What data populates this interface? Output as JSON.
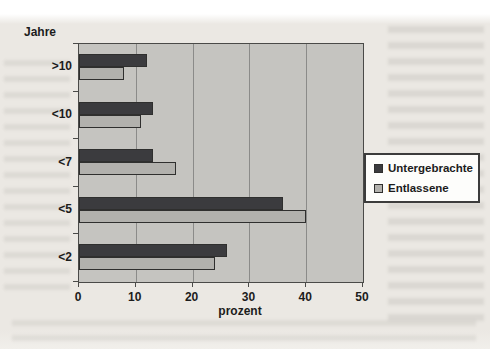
{
  "figure": {
    "y_axis_title": "Jahre",
    "x_axis_title": "prozent",
    "legend_labels": [
      "Untergebrachte",
      "Entlassene"
    ]
  },
  "chart_data": {
    "type": "bar",
    "orientation": "horizontal",
    "title": "",
    "ylabel": "Jahre",
    "xlabel": "prozent",
    "categories": [
      ">10",
      "<10",
      "<7",
      "<5",
      "<2"
    ],
    "series": [
      {
        "name": "Untergebrachte",
        "color": "#3b3b3e",
        "values": [
          12,
          13,
          13,
          36,
          26
        ]
      },
      {
        "name": "Entlassene",
        "color": "#b2b1ad",
        "values": [
          8,
          11,
          17,
          40,
          24
        ]
      }
    ],
    "xlim": [
      0,
      50
    ],
    "x_ticks": [
      0,
      10,
      20,
      30,
      40,
      50
    ],
    "grid": true,
    "legend_position": "right",
    "plot_background": "#c5c4c0",
    "gridline_color": "#8b8b89",
    "axis_color": "#4a4a48"
  }
}
